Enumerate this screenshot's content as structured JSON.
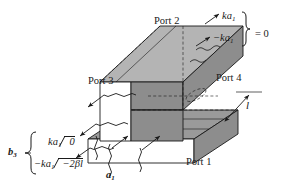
{
  "figure": {
    "background_color": "#ffffff",
    "line_color": "#1a1a1a",
    "face_colors": {
      "top_face": "#9a9a9a",
      "front_face": "#8d8d8d",
      "side_face": "#b4b4b4",
      "open_face": "#ffffff"
    }
  },
  "labels": {
    "port1": "Port 1",
    "port2": "Port 2",
    "port3": "Port 3",
    "port4": "Port 4",
    "length": "l",
    "b3_group": "b",
    "b3_sub": "3",
    "input_a": "a",
    "input_a_sub": "1",
    "eq_zero": "= 0"
  },
  "amplitudes": {
    "top_upper": {
      "coeff": "ka",
      "sub": "1"
    },
    "top_lower": {
      "coeff": "−ka",
      "sub": "1"
    },
    "left_upper": {
      "coeff": "ka",
      "sub": "1",
      "angle": "0"
    },
    "left_lower": {
      "coeff": "−ka",
      "sub": "1",
      "angle": "−2βl"
    }
  }
}
